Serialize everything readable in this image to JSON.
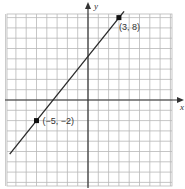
{
  "chart_data": {
    "type": "line",
    "title": "",
    "xlabel": "x",
    "ylabel": "y",
    "xlim": [
      -8,
      8
    ],
    "ylim": [
      -8,
      8
    ],
    "grid": true,
    "series": [
      {
        "name": "line through (-5,-2) and (3,8)",
        "x": [
          -7.6,
          3.5
        ],
        "y": [
          -5.25,
          8.6
        ],
        "slope": 1.25,
        "intercept": 4.25
      }
    ],
    "points": [
      {
        "x": -5,
        "y": -2,
        "label": "(−5, −2)"
      },
      {
        "x": 3,
        "y": 8,
        "label": "(3, 8)"
      }
    ]
  },
  "colors": {
    "grid": "#b8b8b8",
    "axis": "#333333",
    "line": "#2a2a2a",
    "point": "#111111"
  }
}
